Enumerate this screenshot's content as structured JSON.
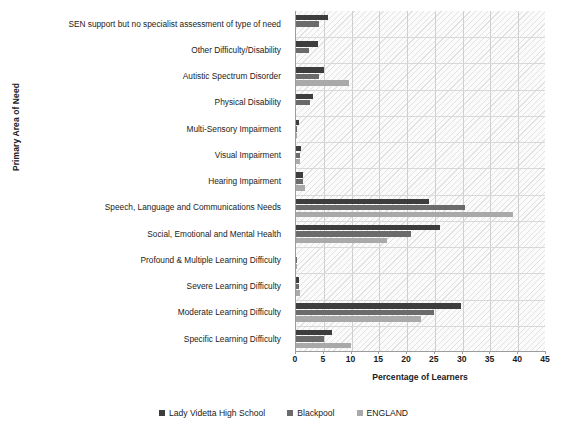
{
  "chart_data": {
    "type": "bar",
    "orientation": "horizontal",
    "title": "",
    "xlabel": "Percentage of Learners",
    "ylabel": "Primary Area of Need",
    "xlim": [
      0,
      45
    ],
    "xticks": [
      0,
      5,
      10,
      15,
      20,
      25,
      30,
      35,
      40,
      45
    ],
    "grid": true,
    "legend_position": "bottom",
    "categories": [
      "SEN support but no specialist assessment of type of need",
      "Other Difficulty/Disability",
      "Autistic Spectrum Disorder",
      "Physical Disability",
      "Multi-Sensory Impairment",
      "Visual Impairment",
      "Hearing Impairment",
      "Speech, Language and Communications Needs",
      "Social, Emotional and Mental Health",
      "Profound & Multiple Learning Difficulty",
      "Severe Learning Difficulty",
      "Moderate Learning Difficulty",
      "Specific Learning Difficulty"
    ],
    "series": [
      {
        "name": "Lady Videtta High School",
        "color": "#3d3d3d",
        "values": [
          5.8,
          4.0,
          5.0,
          3.0,
          0.6,
          0.9,
          1.2,
          24.0,
          26.0,
          0.0,
          0.5,
          29.7,
          6.5
        ]
      },
      {
        "name": "Blackpool",
        "color": "#6b6b6b",
        "values": [
          4.2,
          2.4,
          4.1,
          2.6,
          0.2,
          0.7,
          1.3,
          30.5,
          20.7,
          0.2,
          0.6,
          24.8,
          5.0
        ]
      },
      {
        "name": "ENGLAND",
        "color": "#a9a9a9",
        "values": [
          0.0,
          0.0,
          9.5,
          0.0,
          0.2,
          0.7,
          1.7,
          39.0,
          16.3,
          0.2,
          0.7,
          22.5,
          9.9
        ]
      }
    ]
  },
  "legend": {
    "items": [
      {
        "label": "Lady Videtta High School",
        "color": "#3d3d3d"
      },
      {
        "label": "Blackpool",
        "color": "#6b6b6b"
      },
      {
        "label": "ENGLAND",
        "color": "#a9a9a9"
      }
    ]
  }
}
